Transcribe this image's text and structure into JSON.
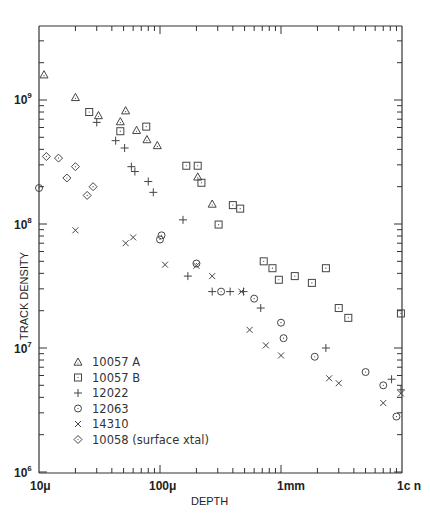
{
  "chart_data": {
    "type": "scatter",
    "title": "",
    "xlabel": "DEPTH",
    "ylabel": "TRACK DENSITY",
    "x_scale": "log",
    "y_scale": "log",
    "x_unit": "micrometers",
    "xlim": [
      10,
      10000
    ],
    "ylim": [
      1000000,
      4000000000
    ],
    "x_ticks": [
      {
        "value": 10,
        "label": "10μ"
      },
      {
        "value": 100,
        "label": "100μ"
      },
      {
        "value": 1000,
        "label": "1mm"
      },
      {
        "value": 10000,
        "label": "1c n"
      }
    ],
    "y_ticks": [
      {
        "value": 1000000,
        "label": "10",
        "exp": "6"
      },
      {
        "value": 10000000,
        "label": "10",
        "exp": "7"
      },
      {
        "value": 100000000,
        "label": "10",
        "exp": "8"
      },
      {
        "value": 1000000000,
        "label": "10",
        "exp": "9"
      }
    ],
    "grid": false,
    "legend_position": "lower-left inside",
    "series": [
      {
        "name": "10057 A",
        "marker": "triangle",
        "points": [
          [
            11,
            1600000000.0
          ],
          [
            20,
            1050000000.0
          ],
          [
            31,
            750000000.0
          ],
          [
            47,
            670000000.0
          ],
          [
            52,
            820000000.0
          ],
          [
            64,
            570000000.0
          ],
          [
            78,
            480000000.0
          ],
          [
            95,
            430000000.0
          ],
          [
            205,
            240000000.0
          ],
          [
            270,
            145000000.0
          ]
        ]
      },
      {
        "name": "10057 B",
        "marker": "square",
        "points": [
          [
            26,
            800000000.0
          ],
          [
            47,
            560000000.0
          ],
          [
            77,
            610000000.0
          ],
          [
            165,
            295000000.0
          ],
          [
            205,
            295000000.0
          ],
          [
            220,
            215000000.0
          ],
          [
            305,
            99000000.0
          ],
          [
            400,
            142000000.0
          ],
          [
            460,
            133000000.0
          ],
          [
            720,
            50000000.0
          ],
          [
            850,
            44000000.0
          ],
          [
            960,
            35500000.0
          ],
          [
            1300,
            38000000.0
          ],
          [
            1800,
            33500000.0
          ],
          [
            2350,
            44000000.0
          ],
          [
            3000,
            21000000.0
          ],
          [
            3600,
            17500000.0
          ],
          [
            9800,
            19000000.0
          ]
        ]
      },
      {
        "name": "12022",
        "marker": "plus",
        "points": [
          [
            30,
            660000000.0
          ],
          [
            43,
            470000000.0
          ],
          [
            51,
            410000000.0
          ],
          [
            58,
            290000000.0
          ],
          [
            62,
            265000000.0
          ],
          [
            80,
            220000000.0
          ],
          [
            88,
            180000000.0
          ],
          [
            155,
            108000000.0
          ],
          [
            170,
            38000000.0
          ],
          [
            270,
            28500000.0
          ],
          [
            380,
            28500000.0
          ],
          [
            490,
            28500000.0
          ],
          [
            680,
            21000000.0
          ],
          [
            2350,
            10000000.0
          ],
          [
            8200,
            5600000.0
          ],
          [
            9800,
            4600000.0
          ]
        ]
      },
      {
        "name": "12063",
        "marker": "circle",
        "points": [
          [
            10,
            195000000.0
          ],
          [
            100,
            75000000.0
          ],
          [
            103,
            81000000.0
          ],
          [
            200,
            48000000.0
          ],
          [
            320,
            28500000.0
          ],
          [
            600,
            25000000.0
          ],
          [
            1000,
            16000000.0
          ],
          [
            1050,
            12000000.0
          ],
          [
            1900,
            8500000.0
          ],
          [
            5000,
            6400000.0
          ],
          [
            7000,
            5000000.0
          ],
          [
            9000,
            2800000.0
          ]
        ]
      },
      {
        "name": "14310",
        "marker": "x",
        "points": [
          [
            20,
            89000000.0
          ],
          [
            52,
            70000000.0
          ],
          [
            60,
            78000000.0
          ],
          [
            110,
            47000000.0
          ],
          [
            200,
            46000000.0
          ],
          [
            270,
            38000000.0
          ],
          [
            470,
            28500000.0
          ],
          [
            550,
            14000000.0
          ],
          [
            750,
            10500000.0
          ],
          [
            1000,
            8700000.0
          ],
          [
            2500,
            5700000.0
          ],
          [
            3000,
            5200000.0
          ],
          [
            7000,
            3600000.0
          ],
          [
            9800,
            4300000.0
          ]
        ]
      },
      {
        "name": "10058 (surface xtal)",
        "marker": "diamond",
        "points": [
          [
            11.5,
            350000000.0
          ],
          [
            14.5,
            340000000.0
          ],
          [
            17,
            235000000.0
          ],
          [
            20,
            290000000.0
          ],
          [
            25,
            170000000.0
          ],
          [
            28,
            200000000.0
          ]
        ]
      }
    ]
  },
  "legend": {
    "items": [
      {
        "label": "10057 A",
        "marker": "triangle"
      },
      {
        "label": "10057 B",
        "marker": "square"
      },
      {
        "label": "12022",
        "marker": "plus"
      },
      {
        "label": "12063",
        "marker": "circle"
      },
      {
        "label": "14310",
        "marker": "x"
      },
      {
        "label": "10058 (surface xtal)",
        "marker": "diamond"
      }
    ]
  },
  "axes": {
    "x_title": "DEPTH",
    "y_title": "TRACK DENSITY",
    "x_labels": [
      "10μ",
      "100μ",
      "1mm",
      "1c n"
    ],
    "y_labels": [
      "10",
      "10",
      "10",
      "10"
    ],
    "y_exps": [
      "9",
      "8",
      "7",
      "6"
    ]
  }
}
